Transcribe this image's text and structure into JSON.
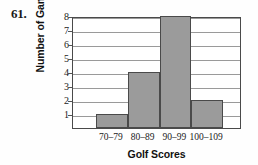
{
  "problem": {
    "number": "61."
  },
  "chart_data": {
    "type": "bar",
    "title": "",
    "subtitle": "",
    "xlabel": "Golf Scores",
    "ylabel": "Number of Games",
    "categories": [
      "70–79",
      "80–89",
      "90–99",
      "100–109"
    ],
    "values": [
      1,
      4,
      8,
      2
    ],
    "series": [
      {
        "name": "Number of Games",
        "values": [
          1,
          4,
          8,
          2
        ]
      }
    ],
    "ylim": [
      0,
      8
    ],
    "yticks": [
      1,
      2,
      3,
      4,
      5,
      6,
      7,
      8
    ],
    "ytick_labels": [
      "1",
      "2",
      "3",
      "4",
      "5",
      "6",
      "7",
      "8"
    ],
    "xtick_labels": [
      "70–79",
      "80–89",
      "90–99",
      "100–109"
    ],
    "grid": true,
    "grid_axis": "y",
    "legend": false,
    "legend_position": "none",
    "annotations": [],
    "colors": {
      "bar_fill": "#9b9b9b",
      "bar_edge": "#4a4a4a",
      "gridline": "#9a9a9a",
      "axis": "#4a4a4a",
      "text": "#111111",
      "background": "#fefefe"
    }
  }
}
